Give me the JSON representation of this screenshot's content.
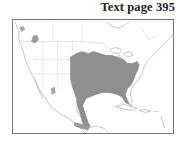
{
  "header": {
    "page_label": "Text page 395"
  },
  "map": {
    "region": "North America",
    "range_color": "#8f8f8f",
    "outline_color": "#9a9a9a",
    "border_color": "#777777"
  }
}
